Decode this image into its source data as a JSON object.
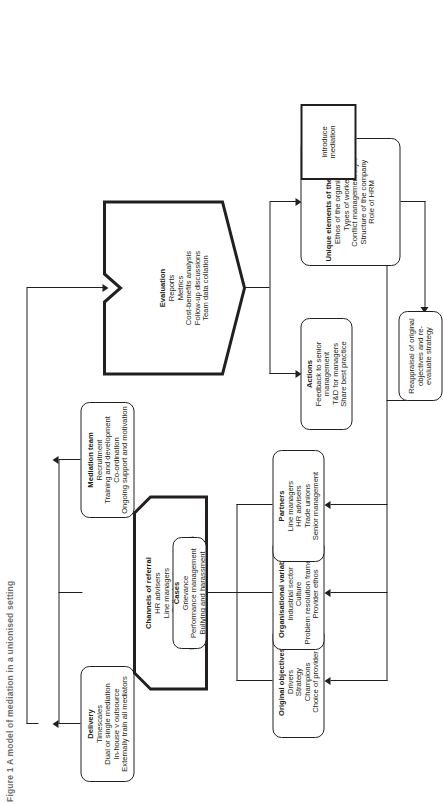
{
  "figure": {
    "caption": "Figure 1  A model of mediation in a unionised setting"
  },
  "nodes": {
    "delivery": {
      "title": "Delivery",
      "items": [
        "Timescales",
        "Dual or single mediation",
        "In-house v outsource",
        "Externally train all mediators"
      ]
    },
    "mediation_team": {
      "title": "Mediation team",
      "items": [
        "Recruitment",
        "Training and development",
        "Co-ordination",
        "Ongoing support and motivation"
      ]
    },
    "channels": {
      "title": "Channels of referral",
      "items": [
        "HR advisers",
        "Line managers",
        "Self-referral",
        "Trade unions",
        "Bullying and harassment advisers"
      ]
    },
    "evaluation": {
      "title": "Evaluation",
      "items": [
        "Reports",
        "Metrics",
        "Cost-benefits analysis",
        "Follow-up discussions",
        "Team data collation"
      ]
    },
    "cases": {
      "title": "Cases",
      "items": [
        "Grievance",
        "Performance management",
        "Bullying and harassment"
      ]
    },
    "objectives": {
      "title": "Original objectives",
      "items": [
        "Drivers",
        "Strategy",
        "Champions",
        "Choice of provider"
      ]
    },
    "org_vars": {
      "title": "Organisational variables",
      "items": [
        "Industrial sector",
        "Culture",
        "Problem resolution framework",
        "Provider ethos"
      ]
    },
    "partners": {
      "title": "Partners",
      "items": [
        "Line managers",
        "HR advisers",
        "Trade unions",
        "Senior management"
      ]
    },
    "actions": {
      "title": "Actions",
      "items": [
        "Feedback to senior management",
        "T&D for managers",
        "Share best practice"
      ]
    },
    "unique": {
      "title": "Unique elements of the company",
      "items": [
        "Ethos of the organisation",
        "Types of workers",
        "Conflict management style",
        "Structure of the company",
        "Role of HRM"
      ]
    },
    "introduce": {
      "title": "",
      "items": [
        "Introduce mediation"
      ]
    },
    "reappraisal": {
      "title": "",
      "items": [
        "Reappraisal of original objectives and re-evaluate strategy"
      ]
    }
  },
  "colors": {
    "line": "#231f20",
    "background": "#ffffff",
    "caption": "#6d6e71"
  }
}
